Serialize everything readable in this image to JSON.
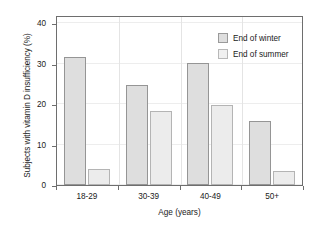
{
  "chart_data": {
    "type": "bar",
    "title": "",
    "xlabel": "Age (years)",
    "ylabel": "Subjects with vitamin D insufficiency (%)",
    "categories": [
      "18-29",
      "30-39",
      "40-49",
      "50+"
    ],
    "series": [
      {
        "name": "End of winter",
        "values": [
          31.7,
          24.7,
          30.2,
          15.9
        ],
        "color": "#dedede"
      },
      {
        "name": "End of summer",
        "values": [
          4.0,
          18.3,
          19.7,
          3.4
        ],
        "color": "#ececec"
      }
    ],
    "ylim": [
      0,
      42
    ],
    "yticks": [
      0,
      10,
      20,
      30,
      40
    ],
    "ytick_labels": [
      "0",
      "10",
      "20",
      "30",
      "40"
    ],
    "grid": true,
    "legend_position": "upper right"
  },
  "legend": {
    "items": [
      {
        "label": "End of winter"
      },
      {
        "label": "End of summer"
      }
    ]
  }
}
